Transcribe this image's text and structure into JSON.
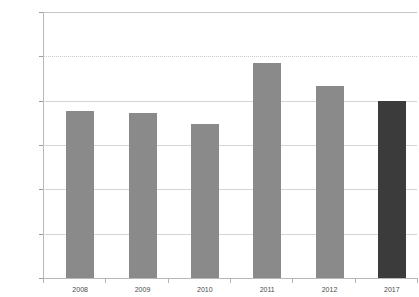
{
  "chart_data": {
    "type": "bar",
    "title": "",
    "xlabel": "",
    "ylabel": "",
    "categories": [
      "2008",
      "2009",
      "2010",
      "2011",
      "2012",
      "2017"
    ],
    "values": [
      1880,
      1860,
      1740,
      2430,
      2170,
      2000
    ],
    "ylim": [
      0,
      3000
    ],
    "ytick_values": [
      0,
      500,
      1000,
      1500,
      2000,
      2500,
      3000
    ],
    "ytick_labels": [
      "$0",
      "$500",
      "$1,000",
      "$1,500",
      "$2,000",
      "$2,500",
      "$3,000"
    ],
    "grid": true,
    "legend": null,
    "bar_colors": [
      "#8a8a8a",
      "#8a8a8a",
      "#8a8a8a",
      "#8a8a8a",
      "#8a8a8a",
      "#3b3b3b"
    ],
    "highlight_category": "2017",
    "colors": {
      "default_bar": "#8a8a8a",
      "highlight_bar": "#3b3b3b",
      "gridline": "#d4d4d4",
      "axis": "#b8b8b8",
      "tick_text": "#4a4a4a",
      "background": "#ffffff"
    }
  }
}
